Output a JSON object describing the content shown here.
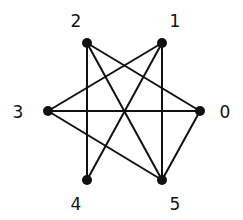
{
  "diagram": {
    "type": "graph",
    "colors": {
      "edge": "#111111",
      "node": "#111111",
      "background": "#ffffff"
    },
    "nodes": [
      {
        "id": "0",
        "label": "0",
        "x": 200,
        "y": 111,
        "lx": 225,
        "ly": 118
      },
      {
        "id": "1",
        "label": "1",
        "x": 162,
        "y": 43,
        "lx": 175,
        "ly": 27
      },
      {
        "id": "2",
        "label": "2",
        "x": 87,
        "y": 43,
        "lx": 76,
        "ly": 27
      },
      {
        "id": "3",
        "label": "3",
        "x": 48,
        "y": 111,
        "lx": 18,
        "ly": 118
      },
      {
        "id": "4",
        "label": "4",
        "x": 87,
        "y": 180,
        "lx": 76,
        "ly": 210
      },
      {
        "id": "5",
        "label": "5",
        "x": 162,
        "y": 180,
        "lx": 175,
        "ly": 210
      }
    ],
    "edges": [
      [
        "2",
        "4"
      ],
      [
        "2",
        "5"
      ],
      [
        "2",
        "0"
      ],
      [
        "1",
        "3"
      ],
      [
        "1",
        "4"
      ],
      [
        "1",
        "5"
      ],
      [
        "3",
        "0"
      ],
      [
        "3",
        "5"
      ],
      [
        "0",
        "5"
      ]
    ]
  }
}
